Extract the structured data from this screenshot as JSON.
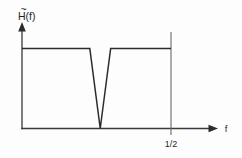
{
  "figure": {
    "background_color": "#fdfdfd",
    "line_color": "#2b2b2b",
    "axis_color": "#3a3a3a",
    "marker_color": "#6a6a6a",
    "y_axis_label": "H(f)",
    "y_axis_label_tilde": "~",
    "x_axis_label": "f",
    "x_tick_label": "1/2"
  },
  "chart_data": {
    "type": "line",
    "title": "",
    "subtitle": "",
    "xlabel": "f",
    "ylabel": "H(f)",
    "ylabel_accent": "tilde",
    "grid": false,
    "legend": null,
    "xlim": [
      0,
      0.58
    ],
    "ylim": [
      0,
      1.25
    ],
    "xticks": [
      0.5
    ],
    "xticklabels": [
      "1/2"
    ],
    "yticks": [],
    "yticklabels": [],
    "annotations": [
      {
        "text": "1/2",
        "x": 0.5,
        "y": 0,
        "position": "below-axis"
      },
      {
        "text": "f",
        "x": 0.575,
        "y": 0,
        "position": "axis-end"
      },
      {
        "text": "H(f)",
        "x": 0,
        "y": 1.22,
        "position": "axis-top"
      }
    ],
    "series": [
      {
        "name": "H-tilde(f)",
        "description": "Ideal notch (band-reject) frequency response: unity passband with a narrow V-shaped null",
        "x": [
          0.0,
          0.2275,
          0.2625,
          0.2975,
          0.5
        ],
        "values": [
          1.0,
          1.0,
          0.0,
          1.0,
          1.0
        ]
      }
    ],
    "notch": {
      "center": 0.2625,
      "left_edge": 0.2275,
      "right_edge": 0.2975,
      "depth": 0.0,
      "passband_level": 1.0
    }
  }
}
